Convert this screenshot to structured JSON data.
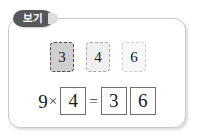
{
  "panel": {
    "tab_label": "보기",
    "border_color": "#c9c9c9"
  },
  "tiles": [
    {
      "value": "3",
      "shade": "dark"
    },
    {
      "value": "4",
      "shade": "mid"
    },
    {
      "value": "6",
      "shade": "light"
    }
  ],
  "equation": {
    "left_operand": "9",
    "multiply_sign": "×",
    "multiplier_box": "4",
    "equals_sign": "=",
    "result_tens_box": "3",
    "result_ones_box": "6"
  },
  "colors": {
    "tab_fill": "#575757",
    "tab_text": "#ffffff",
    "tile_dark_fill": "#cfcfcf",
    "tile_mid_fill": "#efefef",
    "tile_light_fill": "#f8f8f8",
    "answer_box_border": "#707070",
    "ink": "#1a1a1a"
  }
}
